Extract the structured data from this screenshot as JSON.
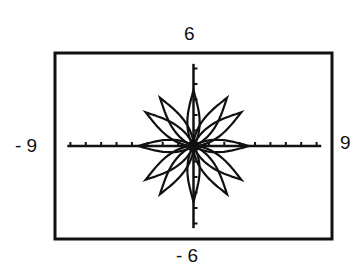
{
  "chart_data": {
    "type": "line",
    "subtype": "polar-rose",
    "title": "",
    "window": {
      "xmin": -9,
      "xmax": 9,
      "ymin": -6,
      "ymax": 6
    },
    "xlabel": "",
    "ylabel": "",
    "tick_labels": {
      "top": "6",
      "bottom": "- 6",
      "left": "- 9",
      "right": "9"
    },
    "axes": {
      "x_tick_spacing": 1,
      "y_tick_spacing": 1,
      "grid": false
    },
    "petals": {
      "diagonal": {
        "count": 8,
        "angles_deg": [
          35,
          55,
          125,
          145,
          215,
          235,
          305,
          325
        ],
        "length": 3.8,
        "half_width": 0.45
      },
      "axial": {
        "count": 4,
        "angles_deg": [
          0,
          90,
          180,
          270
        ],
        "length": 3.6,
        "half_width": 0.4
      }
    }
  }
}
